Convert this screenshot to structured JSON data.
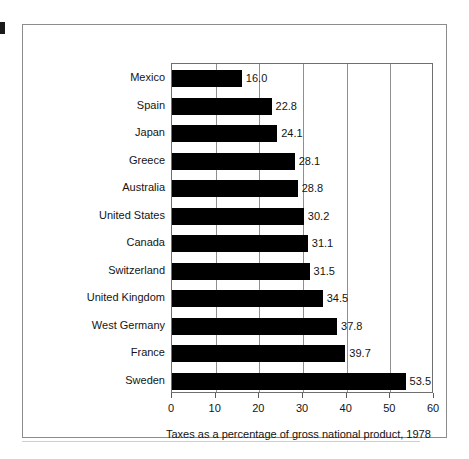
{
  "chart_data": {
    "type": "bar",
    "orientation": "horizontal",
    "title": "",
    "xlabel": "Taxes as a percentage of gross national product, 1978",
    "ylabel": "",
    "xlim": [
      0,
      60
    ],
    "xticks": [
      "0",
      "10",
      "20",
      "30",
      "40",
      "50",
      "60"
    ],
    "grid": true,
    "legend": false,
    "categories": [
      "Mexico",
      "Spain",
      "Japan",
      "Greece",
      "Australia",
      "United States",
      "Canada",
      "Switzerland",
      "United Kingdom",
      "West Germany",
      "France",
      "Sweden"
    ],
    "values": [
      16.0,
      22.8,
      24.1,
      28.1,
      28.8,
      30.2,
      31.1,
      31.5,
      34.5,
      37.8,
      39.7,
      53.5
    ],
    "value_labels": [
      "16.0",
      "22.8",
      "24.1",
      "28.1",
      "28.8",
      "30.2",
      "31.1",
      "31.5",
      "34.5",
      "37.8",
      "39.7",
      "53.5"
    ],
    "bar_color": "#000000",
    "background_color": "#ffffff",
    "axis_color": "#6f6f6f"
  }
}
